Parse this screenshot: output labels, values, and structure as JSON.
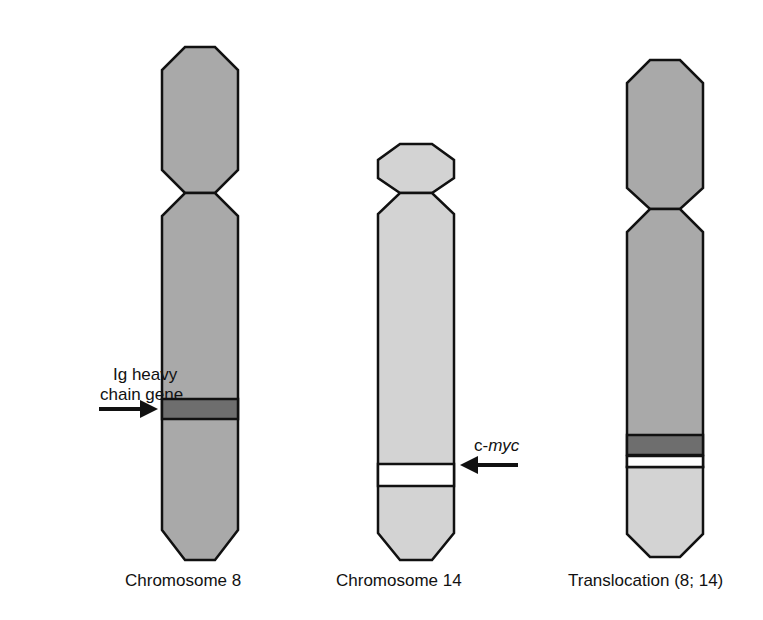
{
  "colors": {
    "chr8": "#a9a9a9",
    "chr14": "#d3d3d3",
    "ig_band": "#6e6e6e",
    "myc_band": "#ffffff",
    "outline": "#111111"
  },
  "chromosomes": [
    {
      "id": "chr8",
      "label": "Chromosome 8"
    },
    {
      "id": "chr14",
      "label": "Chromosome 14"
    },
    {
      "id": "translocation",
      "label": "Translocation (8; 14)"
    }
  ],
  "annotations": {
    "ig_line1": "Ig heavy",
    "ig_line2": "chain gene",
    "myc_prefix": "c-",
    "myc_gene": "myc"
  }
}
